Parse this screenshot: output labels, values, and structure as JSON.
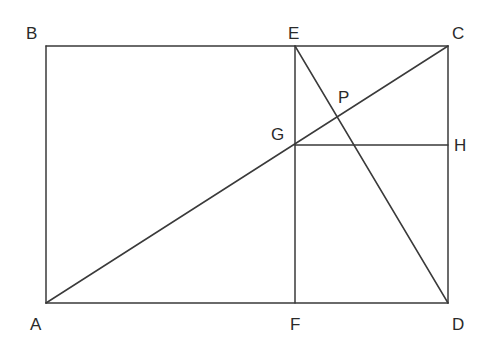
{
  "diagram": {
    "type": "geometry",
    "points": {
      "A": {
        "label": "A"
      },
      "B": {
        "label": "B"
      },
      "C": {
        "label": "C"
      },
      "D": {
        "label": "D"
      },
      "E": {
        "label": "E"
      },
      "F": {
        "label": "F"
      },
      "G": {
        "label": "G"
      },
      "H": {
        "label": "H"
      },
      "P": {
        "label": "P"
      }
    },
    "segments": [
      {
        "name": "AB",
        "from": "A",
        "to": "B"
      },
      {
        "name": "BC",
        "from": "B",
        "to": "C"
      },
      {
        "name": "CD",
        "from": "C",
        "to": "D"
      },
      {
        "name": "DA",
        "from": "D",
        "to": "A"
      },
      {
        "name": "AC",
        "from": "A",
        "to": "C"
      },
      {
        "name": "EF",
        "from": "E",
        "to": "F"
      },
      {
        "name": "GH",
        "from": "G",
        "to": "H"
      },
      {
        "name": "ED",
        "from": "E",
        "to": "D"
      }
    ],
    "line_color": "#3a3a3a",
    "label_color": "#2a2a2a"
  }
}
